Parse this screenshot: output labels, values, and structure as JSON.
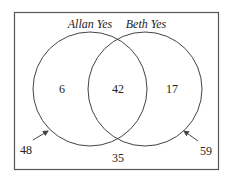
{
  "diagram": {
    "type": "venn",
    "sets": [
      {
        "label": "Allan Yes",
        "only_value": "6",
        "outside_arrow_value": "48"
      },
      {
        "label": "Beth Yes",
        "only_value": "17",
        "outside_arrow_value": "59"
      }
    ],
    "intersection_value": "42",
    "outside_value": "35",
    "colors": {
      "stroke": "#444444",
      "text": "#222222",
      "background": "#ffffff"
    }
  }
}
